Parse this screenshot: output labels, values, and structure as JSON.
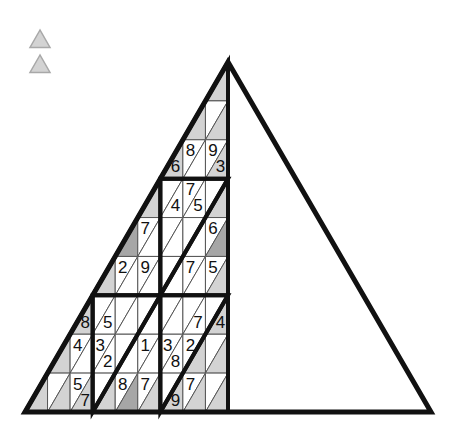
{
  "canvas": {
    "width": 451,
    "height": 438,
    "background": "#ffffff"
  },
  "legend": {
    "name": "legend-triangles",
    "items": [
      {
        "name": "legend-triangle-1",
        "fill": "#d3d3d3",
        "stroke": "#a8a8a8",
        "x": 30,
        "y": 30,
        "size": 20
      },
      {
        "name": "legend-triangle-2",
        "fill": "#d3d3d3",
        "stroke": "#a8a8a8",
        "x": 30,
        "y": 55,
        "size": 20
      }
    ]
  },
  "puzzle": {
    "type": "triangular-sudoku",
    "title": "",
    "rows": 9,
    "apex": {
      "x": 228,
      "y": 62
    },
    "base_left": {
      "x": 25,
      "y": 412
    },
    "base_right": {
      "x": 431,
      "y": 412
    },
    "colors": {
      "white": "#ffffff",
      "light_gray": "#d3d3d3",
      "mid_gray": "#a6a6a6",
      "thin_line": "#555555",
      "thick_line": "#111111",
      "text": "#111111"
    },
    "block_rows": [
      1,
      3,
      5
    ],
    "grid": [
      [
        {
          "o": "up",
          "v": "",
          "s": "light"
        }
      ],
      [
        {
          "o": "up",
          "v": "",
          "s": "light"
        },
        {
          "o": "down",
          "v": "",
          "s": "white"
        },
        {
          "o": "up",
          "v": "",
          "s": "light"
        }
      ],
      [
        {
          "o": "up",
          "v": "6",
          "s": "light"
        },
        {
          "o": "down",
          "v": "8",
          "s": "white"
        },
        {
          "o": "up",
          "v": "",
          "s": "white"
        },
        {
          "o": "down",
          "v": "9",
          "s": "white"
        },
        {
          "o": "up",
          "v": "3",
          "s": "light"
        }
      ],
      [
        {
          "o": "up",
          "v": "",
          "s": "light"
        },
        {
          "o": "down",
          "v": "",
          "s": "white"
        },
        {
          "o": "up",
          "v": "4",
          "s": "white"
        },
        {
          "o": "down",
          "v": "7",
          "s": "white"
        },
        {
          "o": "up",
          "v": "5",
          "s": "white"
        },
        {
          "o": "down",
          "v": "",
          "s": "white"
        },
        {
          "o": "up",
          "v": "",
          "s": "light"
        }
      ],
      [
        {
          "o": "up",
          "v": "",
          "s": "mid"
        },
        {
          "o": "down",
          "v": "7",
          "s": "white"
        },
        {
          "o": "up",
          "v": "",
          "s": "white"
        },
        {
          "o": "down",
          "v": "",
          "s": "white"
        },
        {
          "o": "up",
          "v": "",
          "s": "white"
        },
        {
          "o": "down",
          "v": "",
          "s": "white"
        },
        {
          "o": "up",
          "v": "",
          "s": "white"
        },
        {
          "o": "down",
          "v": "6",
          "s": "white"
        },
        {
          "o": "up",
          "v": "",
          "s": "mid"
        }
      ],
      [
        {
          "o": "up",
          "v": "",
          "s": "light"
        },
        {
          "o": "down",
          "v": "2",
          "s": "white"
        },
        {
          "o": "up",
          "v": "",
          "s": "white"
        },
        {
          "o": "down",
          "v": "9",
          "s": "white"
        },
        {
          "o": "up",
          "v": "",
          "s": "white"
        },
        {
          "o": "down",
          "v": "",
          "s": "white"
        },
        {
          "o": "up",
          "v": "",
          "s": "white"
        },
        {
          "o": "down",
          "v": "7",
          "s": "white"
        },
        {
          "o": "up",
          "v": "",
          "s": "white"
        },
        {
          "o": "down",
          "v": "5",
          "s": "white"
        },
        {
          "o": "up",
          "v": "",
          "s": "light"
        }
      ],
      [
        {
          "o": "up",
          "v": "8",
          "s": "light"
        },
        {
          "o": "down",
          "v": "",
          "s": "white"
        },
        {
          "o": "up",
          "v": "5",
          "s": "white"
        },
        {
          "o": "down",
          "v": "",
          "s": "white"
        },
        {
          "o": "up",
          "v": "",
          "s": "white"
        },
        {
          "o": "down",
          "v": "",
          "s": "white"
        },
        {
          "o": "up",
          "v": "",
          "s": "white"
        },
        {
          "o": "down",
          "v": "",
          "s": "white"
        },
        {
          "o": "up",
          "v": "",
          "s": "white"
        },
        {
          "o": "down",
          "v": "",
          "s": "white"
        },
        {
          "o": "up",
          "v": "7",
          "s": "white"
        },
        {
          "o": "down",
          "v": "",
          "s": "white"
        },
        {
          "o": "up",
          "v": "4",
          "s": "light"
        }
      ],
      [
        {
          "o": "up",
          "v": "",
          "s": "light"
        },
        {
          "o": "down",
          "v": "4",
          "s": "white"
        },
        {
          "o": "up",
          "v": "",
          "s": "white"
        },
        {
          "o": "down",
          "v": "3",
          "s": "white"
        },
        {
          "o": "up",
          "v": "2",
          "s": "white"
        },
        {
          "o": "down",
          "v": "",
          "s": "white"
        },
        {
          "o": "up",
          "v": "",
          "s": "white"
        },
        {
          "o": "down",
          "v": "1",
          "s": "white"
        },
        {
          "o": "up",
          "v": "",
          "s": "white"
        },
        {
          "o": "down",
          "v": "3",
          "s": "white"
        },
        {
          "o": "up",
          "v": "8",
          "s": "white"
        },
        {
          "o": "down",
          "v": "2",
          "s": "white"
        },
        {
          "o": "up",
          "v": "",
          "s": "light"
        },
        {
          "o": "down",
          "v": "",
          "s": "white"
        },
        {
          "o": "up",
          "v": "",
          "s": "light"
        }
      ],
      [
        {
          "o": "up",
          "v": "",
          "s": "light"
        },
        {
          "o": "down",
          "v": "",
          "s": "white"
        },
        {
          "o": "up",
          "v": "",
          "s": "light"
        },
        {
          "o": "down",
          "v": "5",
          "s": "white"
        },
        {
          "o": "up",
          "v": "7",
          "s": "light"
        },
        {
          "o": "down",
          "v": "",
          "s": "white"
        },
        {
          "o": "up",
          "v": "",
          "s": "light"
        },
        {
          "o": "down",
          "v": "8",
          "s": "white"
        },
        {
          "o": "up",
          "v": "",
          "s": "mid"
        },
        {
          "o": "down",
          "v": "7",
          "s": "white"
        },
        {
          "o": "up",
          "v": "",
          "s": "light"
        },
        {
          "o": "down",
          "v": "",
          "s": "white"
        },
        {
          "o": "up",
          "v": "9",
          "s": "light"
        },
        {
          "o": "down",
          "v": "7",
          "s": "white"
        },
        {
          "o": "up",
          "v": "",
          "s": "light"
        },
        {
          "o": "down",
          "v": "",
          "s": "white"
        },
        {
          "o": "up",
          "v": "",
          "s": "light"
        }
      ]
    ]
  }
}
